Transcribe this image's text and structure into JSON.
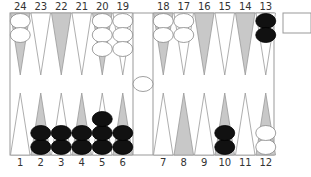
{
  "game": "Backgammon",
  "colors": {
    "board_bg": "#ffffff",
    "border": "#999999",
    "point_dark": "#c8c8c8",
    "point_light": "#ffffff",
    "checker_black": "#111111",
    "checker_white": "#ffffff",
    "checker_outline": "#888888"
  },
  "top_labels": [
    "24",
    "23",
    "22",
    "21",
    "20",
    "19",
    "18",
    "17",
    "16",
    "15",
    "14",
    "13"
  ],
  "bottom_labels": [
    "1",
    "2",
    "3",
    "4",
    "5",
    "6",
    "7",
    "8",
    "9",
    "10",
    "11",
    "12"
  ],
  "points": [
    {
      "point": 1,
      "color": "none",
      "count": 0
    },
    {
      "point": 2,
      "color": "black",
      "count": 2
    },
    {
      "point": 3,
      "color": "black",
      "count": 2
    },
    {
      "point": 4,
      "color": "black",
      "count": 2
    },
    {
      "point": 5,
      "color": "black",
      "count": 3
    },
    {
      "point": 6,
      "color": "black",
      "count": 2
    },
    {
      "point": 7,
      "color": "none",
      "count": 0
    },
    {
      "point": 8,
      "color": "none",
      "count": 0
    },
    {
      "point": 9,
      "color": "none",
      "count": 0
    },
    {
      "point": 10,
      "color": "black",
      "count": 2
    },
    {
      "point": 11,
      "color": "none",
      "count": 0
    },
    {
      "point": 12,
      "color": "white",
      "count": 2
    },
    {
      "point": 13,
      "color": "black",
      "count": 2
    },
    {
      "point": 14,
      "color": "none",
      "count": 0
    },
    {
      "point": 15,
      "color": "none",
      "count": 0
    },
    {
      "point": 16,
      "color": "none",
      "count": 0
    },
    {
      "point": 17,
      "color": "white",
      "count": 2
    },
    {
      "point": 18,
      "color": "white",
      "count": 2
    },
    {
      "point": 19,
      "color": "white",
      "count": 3
    },
    {
      "point": 20,
      "color": "white",
      "count": 3
    },
    {
      "point": 21,
      "color": "none",
      "count": 0
    },
    {
      "point": 22,
      "color": "none",
      "count": 0
    },
    {
      "point": 23,
      "color": "none",
      "count": 0
    },
    {
      "point": 24,
      "color": "white",
      "count": 2
    }
  ],
  "bar": {
    "white": 1,
    "black": 0
  },
  "cube": {
    "value": ""
  }
}
